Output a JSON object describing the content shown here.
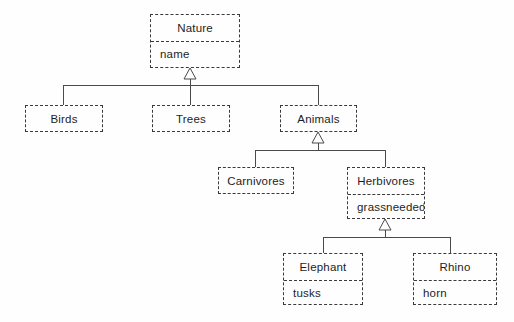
{
  "diagram": {
    "type": "uml-class-diagram",
    "background_color": "#fefefe",
    "border_color": "#3a3a3a",
    "line_color": "#4a4a4a",
    "text_color": "#1d1d1d",
    "relationship": "generalization"
  },
  "classes": {
    "nature": {
      "name": "Nature",
      "attribute": "name"
    },
    "birds": {
      "name": "Birds",
      "attribute": ""
    },
    "trees": {
      "name": "Trees",
      "attribute": ""
    },
    "animals": {
      "name": "Animals",
      "attribute": ""
    },
    "carnivores": {
      "name": "Carnivores",
      "attribute": ""
    },
    "herbivores": {
      "name": "Herbivores",
      "attribute": "grassneeded"
    },
    "elephant": {
      "name": "Elephant",
      "attribute": "tusks"
    },
    "rhino": {
      "name": "Rhino",
      "attribute": "horn"
    }
  }
}
